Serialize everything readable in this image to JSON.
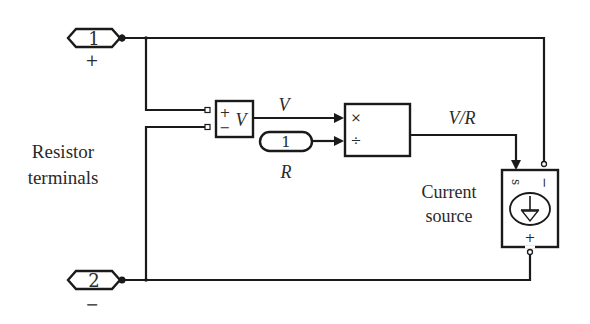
{
  "diagram": {
    "type": "simulink-block-diagram",
    "colors": {
      "line": "#1a1a1a",
      "text": "#2a2a2a",
      "background": "#ffffff"
    },
    "ports": [
      {
        "id": "port-1",
        "label": "1",
        "polarity": "+"
      },
      {
        "id": "port-2",
        "label": "2",
        "polarity": "−"
      }
    ],
    "side_label": {
      "line1": "Resistor",
      "line2": "terminals"
    },
    "voltmeter": {
      "plus": "+",
      "minus": "−",
      "symbol": "V"
    },
    "constant": {
      "value": "1",
      "label": "R"
    },
    "signals": {
      "v": "V",
      "vr": "V/R"
    },
    "product": {
      "in1": "×",
      "in2": "÷"
    },
    "current_source": {
      "label_line1": "Current",
      "label_line2": "source",
      "port_s": "s",
      "port_minus": "−",
      "port_plus": "+"
    }
  }
}
